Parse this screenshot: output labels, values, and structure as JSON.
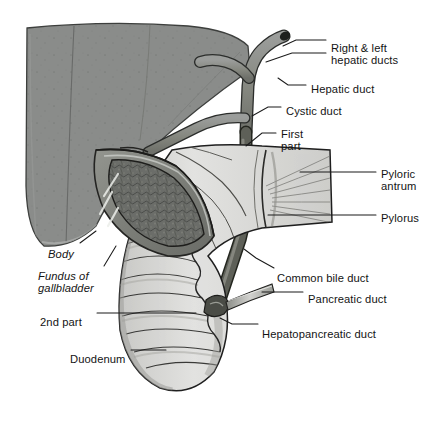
{
  "figure": {
    "background": "#ffffff",
    "width": 437,
    "height": 434
  },
  "palette": {
    "liver_fill": "#8a8c8a",
    "liver_edge": "#3a3c3a",
    "duct_fill": "#8d8f8d",
    "duct_edge": "#2a2c2a",
    "gallbladder_wall": "#7e807e",
    "gallbladder_mucosa": "#6e706c",
    "gut_fill": "#dcdcda",
    "gut_shade": "#b6b6b3",
    "gut_edge": "#232323",
    "label_color": "#141414",
    "leader_color": "#1a1a1a"
  },
  "labels": [
    {
      "id": "right-left-hepatic-ducts",
      "lines": [
        "Right & left",
        "hepatic ducts"
      ],
      "x": 331,
      "y": 42
    },
    {
      "id": "hepatic-duct",
      "lines": [
        "Hepatic duct"
      ],
      "x": 311,
      "y": 83
    },
    {
      "id": "cystic-duct",
      "lines": [
        "Cystic duct"
      ],
      "x": 286,
      "y": 105
    },
    {
      "id": "first-part",
      "lines": [
        "First",
        "part"
      ],
      "x": 281,
      "y": 128
    },
    {
      "id": "pyloric-antrum",
      "lines": [
        "Pyloric",
        "antrum"
      ],
      "x": 381,
      "y": 168
    },
    {
      "id": "pylorus",
      "lines": [
        "Pylorus"
      ],
      "x": 381,
      "y": 212
    },
    {
      "id": "common-bile-duct",
      "lines": [
        "Common bile duct"
      ],
      "x": 277,
      "y": 272
    },
    {
      "id": "pancreatic-duct",
      "lines": [
        "Pancreatic duct"
      ],
      "x": 308,
      "y": 293
    },
    {
      "id": "hepatopancreatic-duct",
      "lines": [
        "Hepatopancreatic duct"
      ],
      "x": 262,
      "y": 328
    },
    {
      "id": "body",
      "lines": [
        "Body"
      ],
      "x": 48,
      "y": 248,
      "italic": true
    },
    {
      "id": "fundus-of-gallbladder",
      "lines": [
        "Fundus of",
        "gallbladder"
      ],
      "x": 38,
      "y": 270,
      "italic": true
    },
    {
      "id": "2nd-part",
      "lines": [
        "2nd part"
      ],
      "x": 40,
      "y": 316
    },
    {
      "id": "duodenum",
      "lines": [
        "Duodenum"
      ],
      "x": 70,
      "y": 353
    }
  ],
  "leaders": [
    {
      "id": "leader-right-hepatic",
      "d": "M326 40 L296 40 L283 46"
    },
    {
      "id": "leader-left-hepatic",
      "d": "M326 53 L292 53 L266 62"
    },
    {
      "id": "leader-hepatic-duct",
      "d": "M306 85 L288 85 L278 78"
    },
    {
      "id": "leader-cystic-duct",
      "d": "M281 107 L268 107 L252 116"
    },
    {
      "id": "leader-first-part",
      "d": "M276 133 L262 133 L246 146"
    },
    {
      "id": "leader-pyloric-antrum",
      "d": "M376 172 L300 172"
    },
    {
      "id": "leader-pylorus",
      "d": "M376 215 L268 215"
    },
    {
      "id": "leader-common-bile-duct",
      "d": "M274 268 L256 258 L244 249"
    },
    {
      "id": "leader-pancreatic-duct",
      "d": "M303 292 L262 292"
    },
    {
      "id": "leader-hepatopancreatic",
      "d": "M258 324 L232 324 L220 318"
    },
    {
      "id": "leader-body",
      "d": "M80 243 L96 231"
    },
    {
      "id": "leader-fundus",
      "d": "M104 266 L116 246"
    },
    {
      "id": "leader-2nd-part",
      "d": "M97 313 L196 313"
    },
    {
      "id": "leader-duodenum",
      "d": "M131 350 L166 350"
    }
  ]
}
